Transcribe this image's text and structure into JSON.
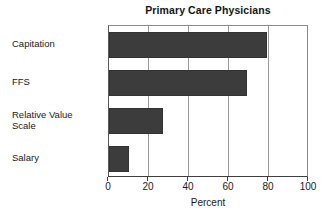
{
  "chart_data": {
    "type": "bar",
    "orientation": "horizontal",
    "title": "Primary Care Physicians",
    "xlabel": "Percent",
    "ylabel": "",
    "categories": [
      "Capitation",
      "FFS",
      "Relative Value\nScale",
      "Salary"
    ],
    "values": [
      79,
      69,
      27,
      10
    ],
    "xlim": [
      0,
      100
    ],
    "xticks": [
      0,
      20,
      40,
      60,
      80,
      100
    ],
    "xtick_labels": [
      "0",
      "20",
      "40",
      "60",
      "80",
      "100"
    ],
    "grid": "vertical",
    "legend": null,
    "bar_color": "#3c3c3c",
    "plot_border_color": "#8a8a8a",
    "gridline_color": "#9a9a9a",
    "background": "#ffffff"
  }
}
